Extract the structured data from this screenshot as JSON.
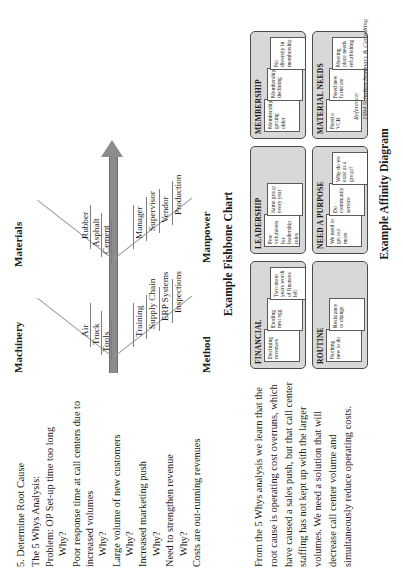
{
  "document": {
    "section_number_title": "5. Determine Root Cause",
    "whys": {
      "heading": "The 5 Whys Analysis:",
      "problem": "Problem: OP Set-up time too long",
      "question_label": "Why?",
      "steps": [
        "Poor response time at call centers due to increased volumes",
        "Large volume of new customers",
        "Increased marketing push",
        "Need to strengthen revenue",
        "Costs are out-running revenues"
      ]
    },
    "analysis_paragraph": "From the 5 Whys analysis we learn that the root cause is operating cost overruns, which have caused a sales push, but that call center staffing has not kept up with the larger volumes.  We need a solution that will decrease call center volume and simultaneously reduce operating costs."
  },
  "fishbone": {
    "caption": "Example Fishbone Chart",
    "categories": [
      {
        "name": "Machinery",
        "position": "top-left",
        "causes": [
          "Air",
          "Truck",
          "Tools"
        ]
      },
      {
        "name": "Materials",
        "position": "top-right",
        "causes": [
          "Rubber",
          "Asphalt",
          "Cement"
        ]
      },
      {
        "name": "Method",
        "position": "bottom-left",
        "causes": [
          "Training",
          "Supply Chain",
          "ERP Systems",
          "Inspections"
        ]
      },
      {
        "name": "Manpower",
        "position": "bottom-right",
        "causes": [
          "Manager",
          "Supervisor",
          "Vendor",
          "Production"
        ]
      }
    ]
  },
  "affinity": {
    "caption": "Example Affinity Diagram",
    "groups": [
      {
        "title": "FINANCIAL",
        "notes": [
          "Declining revenues",
          "Eroding nest egg",
          "Two more years worth of finances left"
        ]
      },
      {
        "title": "LEADERSHIP",
        "notes": [
          "Few volunteers for leadership roles",
          "Same group every year",
          ""
        ]
      },
      {
        "title": "MEMBERSHIP",
        "notes": [
          "Membership getting older",
          "Membership declining",
          "No diversity in membership"
        ]
      },
      {
        "title": "ROUTINE",
        "notes": [
          "Nothing new to do",
          "Resistance to change",
          ""
        ]
      },
      {
        "title": "NEED A PURPOSE",
        "notes": [
          "We need to get out more",
          "Do community service",
          "Why do we exist as a group?"
        ]
      },
      {
        "title": "MATERIAL NEEDS",
        "notes": [
          "Need a VCR",
          "Need new furniture",
          "Meeting place needs refurbishing"
        ]
      }
    ]
  },
  "reference": {
    "label": "Reference:",
    "text": "1994 Schulten Seminars & Consulting"
  },
  "colors": {
    "spine": "#8c8c8c",
    "card_fill": "#d8d8d8",
    "note_fill": "#ffffff",
    "text": "#1a1a1a"
  }
}
